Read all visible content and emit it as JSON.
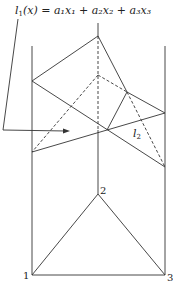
{
  "diagram": {
    "formula": {
      "l": "l",
      "sub": "1",
      "rest": "(x) = a₁x₁ + a₂x₂ + a₃x₃"
    },
    "label_l2": {
      "l": "l",
      "sub": "2"
    },
    "vertices": [
      {
        "id": "1",
        "label": "1"
      },
      {
        "id": "2",
        "label": "2"
      },
      {
        "id": "3",
        "label": "3"
      }
    ],
    "colors": {
      "line": "#333333",
      "background": "#ffffff"
    }
  }
}
